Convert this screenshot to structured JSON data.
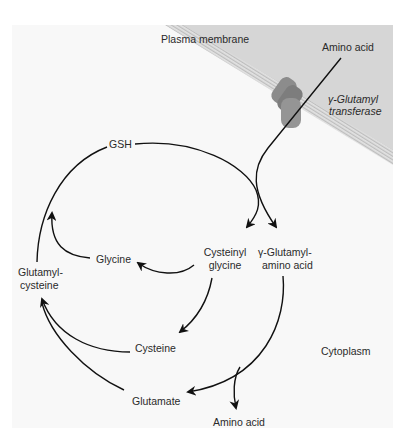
{
  "diagram": {
    "title": "",
    "regions": {
      "membrane_label": "Plasma membrane",
      "cytoplasm_label": "Cytoplasm"
    },
    "enzyme": {
      "line1": "γ-Glutamyl",
      "line2": "transferase"
    },
    "nodes": {
      "amino_acid_in": "Amino acid",
      "gsh": "GSH",
      "glycine": "Glycine",
      "cysteinyl_glycine_1": "Cysteinyl",
      "cysteinyl_glycine_2": "glycine",
      "glutamyl_amino_acid_1": "γ-Glutamyl-",
      "glutamyl_amino_acid_2": "amino acid",
      "glutamyl_cysteine_1": "Glutamyl-",
      "glutamyl_cysteine_2": "cysteine",
      "cysteine": "Cysteine",
      "glutamate": "Glutamate",
      "amino_acid_out": "Amino acid"
    },
    "edges": [
      {
        "from": "Amino acid (extracellular)",
        "to": "γ-Glutamyl-amino acid",
        "via": "γ-Glutamyl transferase"
      },
      {
        "from": "GSH",
        "to": "Cysteinyl glycine"
      },
      {
        "from": "Cysteinyl glycine",
        "to": "Glycine"
      },
      {
        "from": "Cysteinyl glycine",
        "to": "Cysteine"
      },
      {
        "from": "γ-Glutamyl-amino acid",
        "to": "Glutamate"
      },
      {
        "from": "γ-Glutamyl-amino acid",
        "to": "Amino acid"
      },
      {
        "from": "Glutamate",
        "to": "Glutamyl-cysteine"
      },
      {
        "from": "Cysteine",
        "to": "Glutamyl-cysteine"
      },
      {
        "from": "Glutamyl-cysteine",
        "to": "GSH"
      },
      {
        "from": "Glycine",
        "to": "GSH"
      }
    ],
    "colors": {
      "panel_bg": "#f8f8f8",
      "extracellular_bg": "#d6d6d6",
      "membrane": "#c8c8c8",
      "protein": "#8a8a8a",
      "line": "#111111"
    }
  }
}
